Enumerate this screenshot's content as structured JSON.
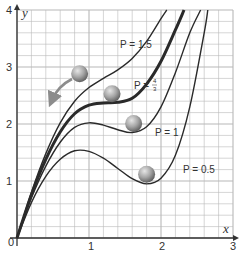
{
  "chart_data": {
    "type": "line",
    "title": "",
    "xlabel": "x",
    "ylabel": "y",
    "xlim": [
      0,
      3
    ],
    "ylim": [
      0,
      4
    ],
    "grid": true,
    "grid_minor_step_x": 0.2,
    "grid_minor_step_y": 0.2,
    "x_ticks": [
      "0",
      "1",
      "2",
      "3"
    ],
    "y_ticks": [
      "1",
      "2",
      "3",
      "4"
    ],
    "legend_position": "inline labels",
    "series": [
      {
        "name": "P = 0.5",
        "label": "P = 0.5",
        "emphasis": "normal",
        "x": [
          0,
          0.2,
          0.4,
          0.6,
          0.8,
          1.0,
          1.2,
          1.4,
          1.6,
          1.8,
          2.0,
          2.2,
          2.4,
          2.6,
          2.65
        ],
        "y": [
          0,
          0.62,
          1.08,
          1.38,
          1.53,
          1.52,
          1.4,
          1.22,
          1.04,
          0.95,
          1.05,
          1.45,
          2.3,
          3.6,
          4.0
        ]
      },
      {
        "name": "P = 1",
        "label": "P = 1",
        "emphasis": "normal",
        "x": [
          0,
          0.2,
          0.4,
          0.6,
          0.8,
          1.0,
          1.2,
          1.4,
          1.6,
          1.8,
          2.0,
          2.2,
          2.4,
          2.55
        ],
        "y": [
          0,
          0.7,
          1.26,
          1.68,
          1.94,
          2.02,
          1.98,
          1.9,
          1.85,
          1.95,
          2.3,
          2.9,
          3.6,
          4.0
        ]
      },
      {
        "name": "P = 4/3",
        "label": "P = 4/3",
        "emphasis": "bold",
        "x": [
          0,
          0.2,
          0.4,
          0.6,
          0.8,
          1.0,
          1.2,
          1.4,
          1.6,
          1.8,
          2.0,
          2.2,
          2.32
        ],
        "y": [
          0,
          0.76,
          1.38,
          1.86,
          2.18,
          2.33,
          2.37,
          2.38,
          2.45,
          2.7,
          3.1,
          3.65,
          4.0
        ]
      },
      {
        "name": "P = 1.5",
        "label": "P = 1.5",
        "emphasis": "normal",
        "x": [
          0,
          0.2,
          0.4,
          0.6,
          0.8,
          1.0,
          1.2,
          1.4,
          1.6,
          1.8,
          2.0,
          2.08
        ],
        "y": [
          0,
          0.8,
          1.48,
          2.02,
          2.4,
          2.64,
          2.8,
          2.95,
          3.15,
          3.45,
          3.85,
          4.0
        ]
      }
    ],
    "annotations": [
      {
        "type": "ball",
        "x": 0.87,
        "y": 2.88,
        "on": "near P = 1.5 / P = 4/3"
      },
      {
        "type": "ball",
        "x": 1.32,
        "y": 2.53,
        "on": "P = 4/3 plateau"
      },
      {
        "type": "ball",
        "x": 1.62,
        "y": 2.01,
        "on": "P = 1 local minimum"
      },
      {
        "type": "ball",
        "x": 1.8,
        "y": 1.12,
        "on": "P = 0.5 local minimum"
      },
      {
        "type": "arrow",
        "description": "curved grey arrow pointing down-left from upper ball"
      }
    ]
  },
  "labels": {
    "x_axis": "x",
    "y_axis": "y",
    "origin": "0",
    "x1": "1",
    "x2": "2",
    "x3": "3",
    "y1": "1",
    "y2": "2",
    "y3": "3",
    "y4": "4",
    "p15": "P = 1.5",
    "p43_prefix": "P =",
    "p43_num": "4",
    "p43_den": "3",
    "p1": "P = 1",
    "p05": "P = 0.5"
  },
  "colors": {
    "grid": "#b8b8b8",
    "axis": "#333333",
    "curve": "#2a2a2a",
    "ball_light": "#d8d8d8",
    "ball_dark": "#6e6e6e",
    "arrow": "#8c8c8c"
  }
}
